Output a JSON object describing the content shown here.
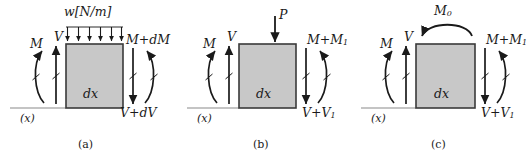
{
  "figure": {
    "type": "free-body-diagram-set",
    "background_color": "#ffffff",
    "element_fill_color": "#c8c8c8",
    "element_stroke_color": "#3a3a3a",
    "arrow_color": "#1a1a1a",
    "baseline_color": "#8a8a8a"
  },
  "panels": [
    {
      "caption": "(a)",
      "element_label": "dx",
      "axis_label": "(x)",
      "top_load": {
        "kind": "distributed-load",
        "label": "w[N/m]",
        "arrow_count": 6,
        "direction": "down"
      },
      "left_moment": {
        "label": "M",
        "direction": "counterclockwise"
      },
      "left_shear": {
        "label": "V",
        "direction": "up"
      },
      "right_moment": {
        "label": "M+dM",
        "direction": "clockwise"
      },
      "right_shear": {
        "label": "V+dV",
        "direction": "down"
      }
    },
    {
      "caption": "(b)",
      "element_label": "dx",
      "axis_label": "(x)",
      "top_load": {
        "kind": "point-load",
        "label": "P",
        "arrow_count": 1,
        "direction": "down"
      },
      "left_moment": {
        "label": "M",
        "direction": "counterclockwise"
      },
      "left_shear": {
        "label": "V",
        "direction": "up"
      },
      "right_moment": {
        "label": "M+M",
        "label_sub": "1",
        "direction": "clockwise"
      },
      "right_shear": {
        "label": "V+V",
        "label_sub": "1",
        "direction": "down"
      }
    },
    {
      "caption": "(c)",
      "element_label": "dx",
      "axis_label": "(x)",
      "top_load": {
        "kind": "applied-moment",
        "label": "M",
        "label_sub": "0",
        "arrow_count": 1,
        "direction": "counterclockwise"
      },
      "left_moment": {
        "label": "M",
        "direction": "counterclockwise"
      },
      "left_shear": {
        "label": "V",
        "direction": "up"
      },
      "right_moment": {
        "label": "M+M",
        "label_sub": "1",
        "direction": "clockwise"
      },
      "right_shear": {
        "label": "V+V",
        "label_sub": "1",
        "direction": "down"
      }
    }
  ]
}
